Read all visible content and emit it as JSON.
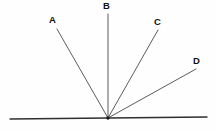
{
  "figure": {
    "canvas": {
      "width": 217,
      "height": 130
    },
    "background_color": "#fefefe",
    "line_color": "#4a4a4a",
    "baseline_color": "#2f2f2f",
    "label_color": "#111111",
    "vertex": {
      "x": 108,
      "y": 118,
      "label": ""
    },
    "baseline": {
      "name": "horizontal-baseline",
      "x1": 10,
      "y1": 119,
      "x2": 207,
      "y2": 117
    },
    "rays": [
      {
        "label": "A",
        "tip_x": 57,
        "tip_y": 29,
        "label_x": 49,
        "label_y": 15
      },
      {
        "label": "B",
        "tip_x": 108,
        "tip_y": 14,
        "label_x": 103,
        "label_y": 1
      },
      {
        "label": "C",
        "tip_x": 158,
        "tip_y": 30,
        "label_x": 154,
        "label_y": 17
      },
      {
        "label": "D",
        "tip_x": 196,
        "tip_y": 69,
        "label_x": 193,
        "label_y": 56
      }
    ]
  }
}
